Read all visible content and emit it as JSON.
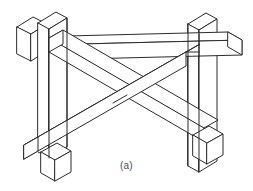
{
  "figure": {
    "caption": "(a)",
    "colors": {
      "background": "#ffffff",
      "line": "#2b2b2b",
      "face": "#ffffff",
      "caption_text": "#4a4a4a"
    },
    "projection": "isometric",
    "parts": [
      {
        "name": "left-rear-post",
        "role": "vertical post",
        "label": "left rear post"
      },
      {
        "name": "left-front-post",
        "role": "vertical post",
        "label": "left front post"
      },
      {
        "name": "right-post",
        "role": "vertical post",
        "label": "right post"
      },
      {
        "name": "upper-beam",
        "role": "horizontal beam",
        "label": "upper crossing beam"
      },
      {
        "name": "lower-beam",
        "role": "horizontal beam",
        "label": "lower crossing beam"
      },
      {
        "name": "rear-rail",
        "role": "horizontal rail",
        "label": "rear rail"
      },
      {
        "name": "left-foot",
        "role": "foot block",
        "label": "left foot block"
      },
      {
        "name": "right-foot",
        "role": "foot block",
        "label": "right foot block"
      }
    ]
  }
}
